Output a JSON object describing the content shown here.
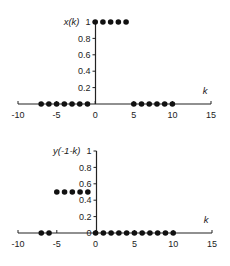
{
  "chart_data": [
    {
      "type": "scatter",
      "title": "",
      "ylabel": "x(k)",
      "xlabel": "k",
      "xlim": [
        -10,
        15
      ],
      "ylim": [
        0,
        1
      ],
      "xticks": [
        -10,
        -5,
        0,
        5,
        10,
        15
      ],
      "yticks": [
        0.2,
        0.4,
        0.6,
        0.8,
        1
      ],
      "ytick_labels": [
        "0.2",
        "0.4",
        "0.6",
        "0.8",
        "1"
      ],
      "grid": false,
      "legend": null,
      "series": [
        {
          "name": "x(k)",
          "x": [
            -7,
            -6,
            -5,
            -4,
            -3,
            -2,
            -1,
            0,
            1,
            2,
            3,
            4,
            5,
            6,
            7,
            8,
            9,
            10
          ],
          "y": [
            0,
            0,
            0,
            0,
            0,
            0,
            0,
            1,
            1,
            1,
            1,
            1,
            0,
            0,
            0,
            0,
            0,
            0
          ]
        }
      ],
      "frame": {
        "x0": 18,
        "x1": 211,
        "y0": 104,
        "y1": 22,
        "axis_x": 95.5
      }
    },
    {
      "type": "scatter",
      "title": "",
      "ylabel": "y(-1-k)",
      "xlabel": "k",
      "xlim": [
        -10,
        15
      ],
      "ylim": [
        0,
        1
      ],
      "xticks": [
        -10,
        -5,
        0,
        5,
        10,
        15
      ],
      "yticks": [
        0,
        0.2,
        0.4,
        0.6,
        0.8,
        1
      ],
      "ytick_labels": [
        "0",
        "0.2",
        "0.4",
        "0.6",
        "0.8",
        "1"
      ],
      "grid": false,
      "legend": null,
      "series": [
        {
          "name": "y(-1-k)",
          "x": [
            -7,
            -6,
            -5,
            -4,
            -3,
            -2,
            -1,
            0,
            1,
            2,
            3,
            4,
            5,
            6,
            7,
            8,
            9,
            10
          ],
          "y": [
            0,
            0,
            0.5,
            0.5,
            0.5,
            0.5,
            0.5,
            0,
            0,
            0,
            0,
            0,
            0,
            0,
            0,
            0,
            0,
            0
          ]
        }
      ],
      "frame": {
        "x0": 18,
        "x1": 212,
        "y0": 233,
        "y1": 151,
        "axis_x": 96.5
      }
    }
  ],
  "colors": {
    "axis": "#222222",
    "marker": "#111111",
    "background": "#ffffff"
  }
}
